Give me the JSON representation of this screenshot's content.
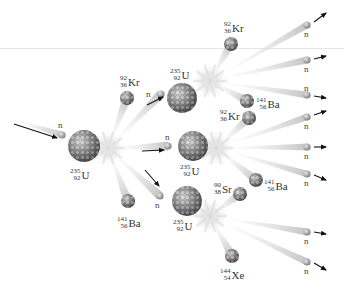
{
  "colors": {
    "nucleus": "#8a8a8a",
    "nucleus_dark": "#4d4d4d",
    "nucleus_light": "#d0d0d0",
    "neutron": "#9a9a9a",
    "trail": "#c8c8c8",
    "arrow": "#111111",
    "text": "#333333",
    "divider": "#e6e6e6"
  },
  "neutron_label": "n",
  "nuclei": [
    {
      "id": "u-initial",
      "mass": "235",
      "atomic": "92",
      "symbol": "U",
      "x": 84,
      "y": 146,
      "r": 16,
      "label_x": 70,
      "label_y": 166
    },
    {
      "id": "u-top",
      "mass": "235",
      "atomic": "92",
      "symbol": "U",
      "x": 182,
      "y": 98,
      "r": 15,
      "label_x": 170,
      "label_y": 66
    },
    {
      "id": "u-middle",
      "mass": "235",
      "atomic": "92",
      "symbol": "U",
      "x": 193,
      "y": 146,
      "r": 15,
      "label_x": 180,
      "label_y": 162
    },
    {
      "id": "u-bottom",
      "mass": "235",
      "atomic": "92",
      "symbol": "U",
      "x": 187,
      "y": 201,
      "r": 15,
      "label_x": 173,
      "label_y": 217
    },
    {
      "id": "kr-1",
      "mass": "92",
      "atomic": "36",
      "symbol": "Kr",
      "x": 127,
      "y": 98,
      "r": 7,
      "label_x": 120,
      "label_y": 73
    },
    {
      "id": "ba-1",
      "mass": "141",
      "atomic": "56",
      "symbol": "Ba",
      "x": 128,
      "y": 201,
      "r": 7,
      "label_x": 117,
      "label_y": 214
    },
    {
      "id": "kr-2",
      "mass": "92",
      "atomic": "36",
      "symbol": "Kr",
      "x": 231,
      "y": 44,
      "r": 7,
      "label_x": 224,
      "label_y": 19
    },
    {
      "id": "ba-2",
      "mass": "141",
      "atomic": "56",
      "symbol": "Ba",
      "x": 247,
      "y": 101,
      "r": 7,
      "label_x": 256,
      "label_y": 95
    },
    {
      "id": "kr-3",
      "mass": "92",
      "atomic": "36",
      "symbol": "Kr",
      "x": 249,
      "y": 118,
      "r": 7,
      "label_x": 220,
      "label_y": 107
    },
    {
      "id": "ba-3",
      "mass": "141",
      "atomic": "56",
      "symbol": "Ba",
      "x": 256,
      "y": 180,
      "r": 7,
      "label_x": 264,
      "label_y": 177
    },
    {
      "id": "sr-1",
      "mass": "90",
      "atomic": "38",
      "symbol": "Sr",
      "x": 240,
      "y": 194,
      "r": 7,
      "label_x": 214,
      "label_y": 180
    },
    {
      "id": "xe-1",
      "mass": "144",
      "atomic": "54",
      "symbol": "Xe",
      "x": 232,
      "y": 256,
      "r": 7,
      "label_x": 220,
      "label_y": 266
    }
  ],
  "flashes": [
    {
      "id": "flash-1",
      "x": 108,
      "y": 148
    },
    {
      "id": "flash-2",
      "x": 210,
      "y": 81
    },
    {
      "id": "flash-3",
      "x": 216,
      "y": 148
    },
    {
      "id": "flash-4",
      "x": 210,
      "y": 216
    }
  ],
  "neutrons": [
    {
      "id": "n-incoming",
      "x": 62,
      "y": 135,
      "label_x": 58,
      "label_y": 121,
      "arrow": [
        14,
        124,
        57,
        138
      ],
      "trail_from": [
        8,
        118
      ]
    },
    {
      "id": "n-gen1-a",
      "x": 161,
      "y": 94,
      "label_x": 146,
      "label_y": 90,
      "arrow": [
        147,
        105,
        163,
        97
      ],
      "trail_from": null
    },
    {
      "id": "n-gen1-b",
      "x": 168,
      "y": 146,
      "label_x": 165,
      "label_y": 133,
      "arrow": [
        142,
        151,
        164,
        150
      ],
      "trail_from": null
    },
    {
      "id": "n-gen1-c",
      "x": 160,
      "y": 196,
      "label_x": 155,
      "label_y": 201,
      "arrow": [
        145,
        170,
        159,
        186
      ],
      "trail_from": null
    },
    {
      "id": "n-out-1",
      "x": 307,
      "y": 25,
      "label_x": 304,
      "label_y": 30,
      "arrow": [
        314,
        22,
        326,
        13
      ],
      "trail_from": [
        210,
        81
      ]
    },
    {
      "id": "n-out-2",
      "x": 307,
      "y": 60,
      "label_x": 304,
      "label_y": 65,
      "arrow": [
        314,
        59,
        326,
        56
      ],
      "trail_from": [
        210,
        81
      ]
    },
    {
      "id": "n-out-3",
      "x": 307,
      "y": 95,
      "label_x": 304,
      "label_y": 84,
      "arrow": [
        314,
        96,
        326,
        98
      ],
      "trail_from": [
        210,
        81
      ]
    },
    {
      "id": "n-out-4",
      "x": 307,
      "y": 117,
      "label_x": 304,
      "label_y": 122,
      "arrow": [
        314,
        115,
        326,
        111
      ],
      "trail_from": [
        216,
        148
      ]
    },
    {
      "id": "n-out-5",
      "x": 307,
      "y": 147,
      "label_x": 304,
      "label_y": 152,
      "arrow": [
        314,
        147,
        326,
        147
      ],
      "trail_from": [
        216,
        148
      ]
    },
    {
      "id": "n-out-6",
      "x": 307,
      "y": 174,
      "label_x": 304,
      "label_y": 179,
      "arrow": [
        314,
        175,
        326,
        180
      ],
      "trail_from": [
        216,
        148
      ]
    },
    {
      "id": "n-out-7",
      "x": 307,
      "y": 232,
      "label_x": 304,
      "label_y": 237,
      "arrow": [
        314,
        232,
        326,
        234
      ],
      "trail_from": [
        210,
        216
      ]
    },
    {
      "id": "n-out-8",
      "x": 307,
      "y": 262,
      "label_x": 304,
      "label_y": 267,
      "arrow": [
        314,
        263,
        326,
        270
      ],
      "trail_from": [
        210,
        216
      ]
    }
  ],
  "fragment_trails": [
    {
      "from": [
        108,
        148
      ],
      "to": "kr-1"
    },
    {
      "from": [
        108,
        148
      ],
      "to": "ba-1"
    },
    {
      "from": [
        108,
        148
      ],
      "to": [
        161,
        94
      ]
    },
    {
      "from": [
        108,
        148
      ],
      "to": [
        168,
        146
      ]
    },
    {
      "from": [
        108,
        148
      ],
      "to": [
        160,
        196
      ]
    },
    {
      "from": [
        210,
        81
      ],
      "to": "kr-2"
    },
    {
      "from": [
        210,
        81
      ],
      "to": "ba-2"
    },
    {
      "from": [
        216,
        148
      ],
      "to": "kr-3"
    },
    {
      "from": [
        216,
        148
      ],
      "to": "ba-3"
    },
    {
      "from": [
        210,
        216
      ],
      "to": "sr-1"
    },
    {
      "from": [
        210,
        216
      ],
      "to": "xe-1"
    }
  ]
}
